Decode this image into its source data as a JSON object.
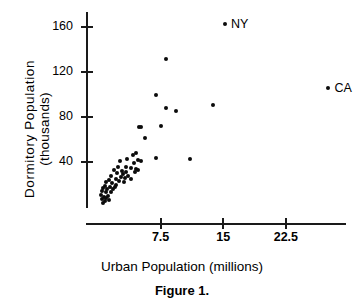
{
  "figure": {
    "caption": "Figure 1."
  },
  "chart_data": {
    "type": "scatter",
    "title": "",
    "xlabel": "Urban Population (millions)",
    "ylabel_line1": "Dormitory  Population",
    "ylabel_line2": "(thousands)",
    "xlim": [
      0,
      31
    ],
    "ylim": [
      0,
      175
    ],
    "grid": false,
    "legend": null,
    "xticks": [
      7.5,
      15,
      22.5
    ],
    "xtick_labels": [
      "7.5",
      "15",
      "22.5"
    ],
    "yticks": [
      40,
      80,
      120,
      160
    ],
    "ytick_labels": [
      "40",
      "80",
      "120",
      "160"
    ],
    "marker": "filled-circle",
    "marker_color": "#0b0b0b",
    "annotations": [
      {
        "label": "NY",
        "x": 15.2,
        "y": 163
      },
      {
        "label": "CA",
        "x": 27.6,
        "y": 106
      }
    ],
    "points": [
      {
        "x": 15.2,
        "y": 163,
        "label": "NY"
      },
      {
        "x": 27.6,
        "y": 106,
        "label": "CA"
      },
      {
        "x": 8.2,
        "y": 132
      },
      {
        "x": 6.9,
        "y": 100
      },
      {
        "x": 8.1,
        "y": 88
      },
      {
        "x": 9.3,
        "y": 85
      },
      {
        "x": 13.8,
        "y": 91
      },
      {
        "x": 7.6,
        "y": 72
      },
      {
        "x": 4.9,
        "y": 71
      },
      {
        "x": 5.2,
        "y": 71
      },
      {
        "x": 5.6,
        "y": 61
      },
      {
        "x": 6.9,
        "y": 44
      },
      {
        "x": 11.0,
        "y": 43
      },
      {
        "x": 4.6,
        "y": 48
      },
      {
        "x": 4.2,
        "y": 46
      },
      {
        "x": 3.5,
        "y": 43
      },
      {
        "x": 4.8,
        "y": 42
      },
      {
        "x": 5.1,
        "y": 41
      },
      {
        "x": 2.6,
        "y": 41
      },
      {
        "x": 4.3,
        "y": 39
      },
      {
        "x": 2.4,
        "y": 36
      },
      {
        "x": 3.3,
        "y": 36
      },
      {
        "x": 3.9,
        "y": 35
      },
      {
        "x": 4.6,
        "y": 34
      },
      {
        "x": 4.8,
        "y": 33
      },
      {
        "x": 1.9,
        "y": 33
      },
      {
        "x": 2.9,
        "y": 32
      },
      {
        "x": 3.4,
        "y": 31
      },
      {
        "x": 4.4,
        "y": 31
      },
      {
        "x": 2.3,
        "y": 30
      },
      {
        "x": 3.0,
        "y": 29
      },
      {
        "x": 3.6,
        "y": 28
      },
      {
        "x": 1.6,
        "y": 28
      },
      {
        "x": 2.7,
        "y": 27
      },
      {
        "x": 3.2,
        "y": 26
      },
      {
        "x": 4.0,
        "y": 25
      },
      {
        "x": 2.1,
        "y": 25
      },
      {
        "x": 1.3,
        "y": 24
      },
      {
        "x": 2.5,
        "y": 23
      },
      {
        "x": 3.1,
        "y": 22
      },
      {
        "x": 1.0,
        "y": 22
      },
      {
        "x": 1.7,
        "y": 21
      },
      {
        "x": 2.2,
        "y": 20
      },
      {
        "x": 0.8,
        "y": 19
      },
      {
        "x": 1.4,
        "y": 18
      },
      {
        "x": 2.0,
        "y": 18
      },
      {
        "x": 0.6,
        "y": 17
      },
      {
        "x": 1.1,
        "y": 16
      },
      {
        "x": 1.8,
        "y": 16
      },
      {
        "x": 0.5,
        "y": 14
      },
      {
        "x": 0.9,
        "y": 13
      },
      {
        "x": 1.5,
        "y": 13
      },
      {
        "x": 0.4,
        "y": 11
      },
      {
        "x": 1.2,
        "y": 10
      },
      {
        "x": 0.7,
        "y": 9
      },
      {
        "x": 1.0,
        "y": 8
      },
      {
        "x": 0.5,
        "y": 7
      },
      {
        "x": 1.3,
        "y": 6
      },
      {
        "x": 0.8,
        "y": 5
      },
      {
        "x": 0.6,
        "y": 4
      }
    ]
  }
}
